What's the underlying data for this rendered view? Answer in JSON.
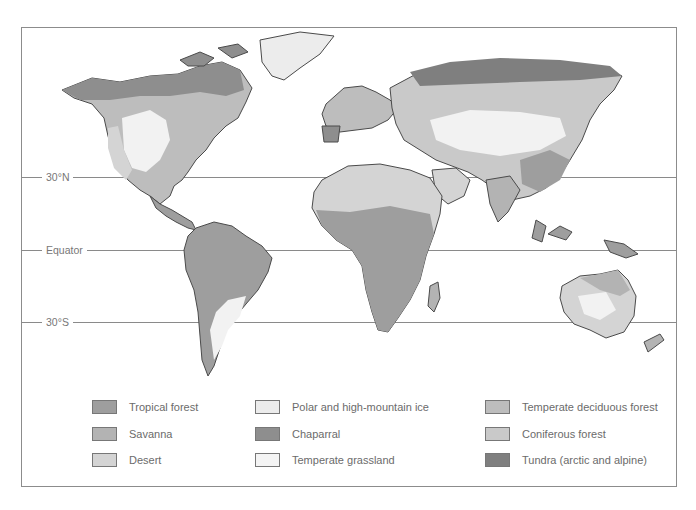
{
  "map": {
    "type": "world biome map",
    "latitude_lines": [
      {
        "label": "30°N",
        "y": 177
      },
      {
        "label": "Equator",
        "y": 250
      },
      {
        "label": "30°S",
        "y": 322
      }
    ]
  },
  "legend": {
    "items": [
      {
        "label": "Tropical forest",
        "color": "#9e9e9e"
      },
      {
        "label": "Savanna",
        "color": "#b3b3b3"
      },
      {
        "label": "Desert",
        "color": "#d4d4d4"
      },
      {
        "label": "Polar and high-mountain ice",
        "color": "#ececec"
      },
      {
        "label": "Chaparral",
        "color": "#8e8e8e"
      },
      {
        "label": "Temperate grassland",
        "color": "#f4f4f4"
      },
      {
        "label": "Temperate deciduous forest",
        "color": "#bdbdbd"
      },
      {
        "label": "Coniferous forest",
        "color": "#c9c9c9"
      },
      {
        "label": "Tundra (arctic and alpine)",
        "color": "#7f7f7f"
      }
    ]
  }
}
